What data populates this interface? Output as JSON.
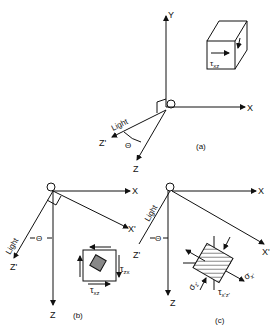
{
  "diagram": {
    "panels": [
      {
        "id": "a",
        "caption": "(a)",
        "origin_label": "O",
        "axes": [
          "X",
          "Y",
          "Z",
          "Z'"
        ],
        "light_label": "Light",
        "angle_label": "Θ",
        "inset": {
          "stress_label": "τ",
          "stress_sub": "xz"
        }
      },
      {
        "id": "b",
        "caption": "(b)",
        "origin_label": "O",
        "axes": [
          "X",
          "X'",
          "Z",
          "Z'"
        ],
        "light_label": "Light",
        "angle_label": "Θ",
        "element": {
          "labels": [
            {
              "main": "τ",
              "sub": "zx"
            },
            {
              "main": "τ",
              "sub": "xz"
            }
          ]
        }
      },
      {
        "id": "c",
        "caption": "(c)",
        "origin_label": "O",
        "axes": [
          "X",
          "X'",
          "Z",
          "Z'"
        ],
        "light_label": "Light",
        "angle_label": "Θ",
        "element": {
          "labels": [
            {
              "main": "σ",
              "sub": "x'"
            },
            {
              "main": "σ",
              "sub": "z'"
            },
            {
              "main": "τ",
              "sub": "x'z'"
            }
          ]
        }
      }
    ]
  }
}
